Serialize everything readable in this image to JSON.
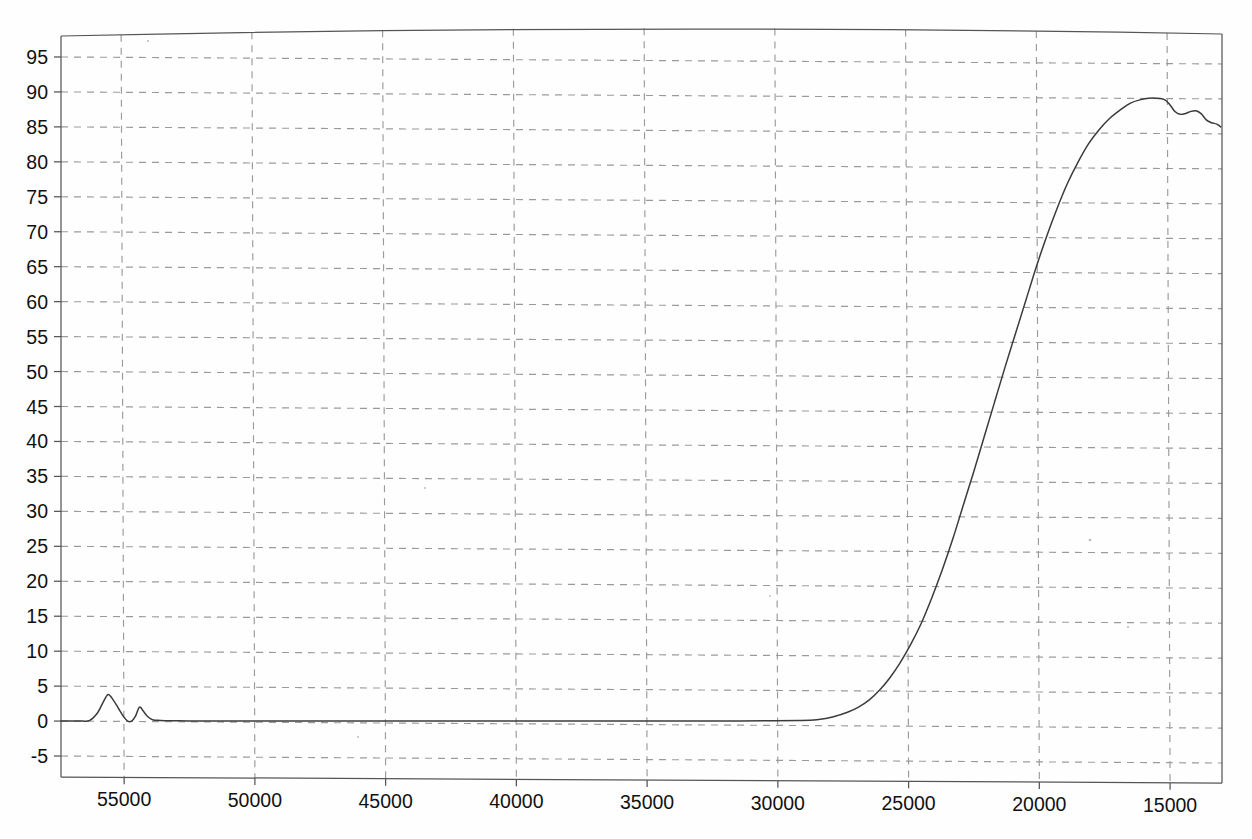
{
  "chart_data": {
    "type": "line",
    "title": "",
    "subtitle": "",
    "xlabel": "",
    "ylabel": "",
    "xlim": [
      57300,
      12900
    ],
    "ylim": [
      -8,
      98
    ],
    "x_reversed": true,
    "grid": true,
    "legend": "none",
    "x_ticks": [
      55000,
      50000,
      45000,
      40000,
      35000,
      30000,
      25000,
      20000,
      15000
    ],
    "x_tick_labels": [
      "55000",
      "50000",
      "45000",
      "40000",
      "35000",
      "30000",
      "25000",
      "20000",
      "15000"
    ],
    "y_ticks": [
      -5,
      0,
      5,
      10,
      15,
      20,
      25,
      30,
      35,
      40,
      45,
      50,
      55,
      60,
      65,
      70,
      75,
      80,
      85,
      90,
      95
    ],
    "y_tick_labels": [
      "-5",
      "0",
      "5",
      "10",
      "15",
      "20",
      "25",
      "30",
      "35",
      "40",
      "45",
      "50",
      "55",
      "60",
      "65",
      "70",
      "75",
      "80",
      "85",
      "90",
      "95"
    ],
    "series": [
      {
        "name": "transmittance",
        "color": "#3b3b3b",
        "x": [
          57300,
          56900,
          56500,
          56200,
          55900,
          55700,
          55500,
          55300,
          55100,
          54900,
          54750,
          54600,
          54450,
          54300,
          54150,
          54000,
          53800,
          53500,
          53000,
          52000,
          50000,
          48000,
          46000,
          44000,
          42000,
          40000,
          38000,
          36000,
          34000,
          32000,
          30000,
          29000,
          28400,
          28000,
          27600,
          27200,
          26800,
          26400,
          26000,
          25600,
          25200,
          24800,
          24400,
          24000,
          23600,
          23200,
          22800,
          22400,
          22000,
          21600,
          21200,
          20800,
          20400,
          20000,
          19600,
          19200,
          18800,
          18400,
          18000,
          17600,
          17200,
          16800,
          16400,
          16000,
          15700,
          15400,
          15100,
          14900,
          14700,
          14500,
          14300,
          14100,
          13900,
          13700,
          13500,
          13300,
          13100,
          12950
        ],
        "y": [
          0,
          0,
          0,
          0.1,
          1.2,
          2.6,
          3.8,
          3.0,
          1.8,
          0.6,
          0.0,
          0.0,
          0.7,
          2.0,
          1.4,
          0.7,
          0.2,
          0.1,
          0.05,
          0.0,
          0.0,
          0.0,
          0.0,
          0.0,
          0.0,
          0.0,
          0.0,
          0.0,
          0.0,
          0.0,
          0.05,
          0.1,
          0.2,
          0.4,
          0.8,
          1.3,
          2.0,
          3.0,
          4.4,
          6.2,
          8.4,
          11.0,
          14.0,
          17.6,
          21.6,
          26.0,
          30.8,
          35.6,
          40.6,
          45.6,
          50.6,
          55.4,
          60.2,
          65.0,
          69.4,
          73.4,
          77.0,
          80.0,
          82.6,
          84.6,
          86.2,
          87.4,
          88.4,
          88.9,
          89.1,
          89.1,
          88.9,
          88.2,
          87.2,
          86.8,
          86.9,
          87.2,
          87.3,
          86.9,
          86.0,
          85.6,
          85.4,
          85.0
        ]
      }
    ]
  },
  "scan_artifacts": {
    "top_border_bow": "slight upward bow across top frame edge",
    "bottom_border_skew": "slight downward skew toward right on bottom frame edge"
  }
}
